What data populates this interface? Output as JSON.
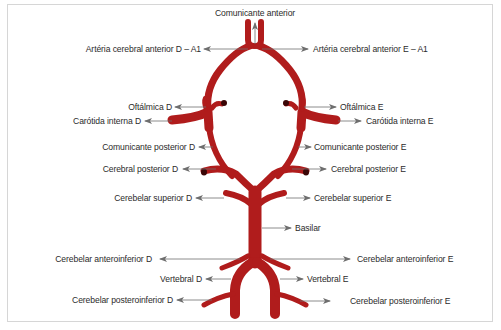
{
  "diagram": {
    "vessel_color": "#b01c1c",
    "vessel_dark": "#7a0f0f",
    "arrow_color": "#6e6e6e",
    "labels": {
      "comunicante_anterior": "Comunicante anterior",
      "aca_d": "Artéria cerebral anterior D – A1",
      "aca_e": "Artéria cerebral anterior E – A1",
      "oftalmica_d": "Oftálmica D",
      "oftalmica_e": "Oftálmica E",
      "carotida_d": "Carótida interna D",
      "carotida_e": "Carótida interna E",
      "com_post_d": "Comunicante posterior D",
      "com_post_e": "Comunicante posterior E",
      "cer_post_d": "Cerebral posterior D",
      "cer_post_e": "Cerebral posterior E",
      "cerebelar_sup_d": "Cerebelar superior D",
      "cerebelar_sup_e": "Cerebelar superior E",
      "basilar": "Basilar",
      "aica_d": "Cerebelar anteroinferior D",
      "aica_e": "Cerebelar anteroinferior E",
      "vertebral_d": "Vertebral D",
      "vertebral_e": "Vertebral E",
      "pica_d": "Cerebelar posteroinferior D",
      "pica_e": "Cerebelar posteroinferior E"
    }
  }
}
